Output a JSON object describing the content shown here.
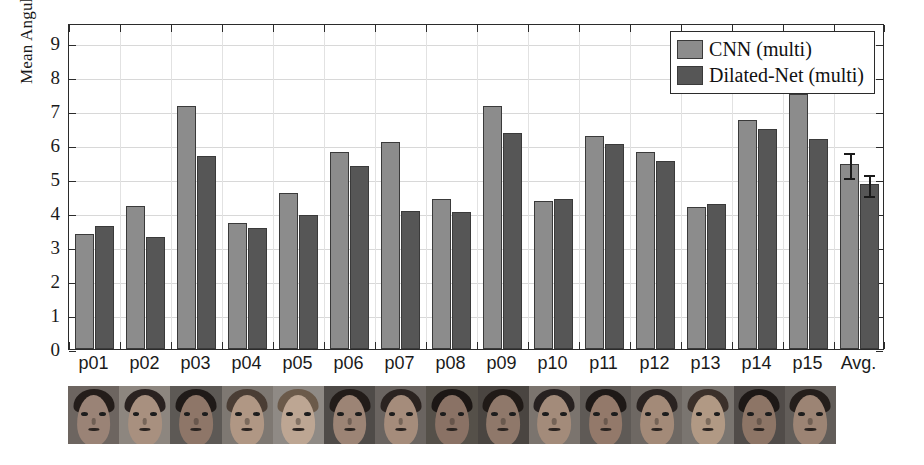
{
  "chart_data": {
    "type": "bar",
    "title": "",
    "xlabel": "",
    "ylabel": "Mean Angular Error (degree)",
    "ylim": [
      0,
      9.6
    ],
    "yticks": [
      0,
      1,
      2,
      3,
      4,
      5,
      6,
      7,
      8,
      9
    ],
    "ytick_labels": [
      "0",
      "1",
      "2",
      "3",
      "4",
      "5",
      "6",
      "7",
      "8",
      "9"
    ],
    "grid": true,
    "legend_position": "top-right",
    "categories": [
      "p01",
      "p02",
      "p03",
      "p04",
      "p05",
      "p06",
      "p07",
      "p08",
      "p09",
      "p10",
      "p11",
      "p12",
      "p13",
      "p14",
      "p15",
      "Avg."
    ],
    "series": [
      {
        "name": "CNN (multi)",
        "color": "#8c8c8c",
        "values": [
          3.4,
          4.22,
          7.16,
          3.72,
          4.6,
          5.79,
          6.09,
          4.42,
          7.16,
          4.37,
          6.26,
          5.8,
          4.17,
          6.75,
          7.5,
          5.46
        ],
        "errors": [
          null,
          null,
          null,
          null,
          null,
          null,
          null,
          null,
          null,
          null,
          null,
          null,
          null,
          null,
          null,
          0.36
        ]
      },
      {
        "name": "Dilated-Net (multi)",
        "color": "#565656",
        "values": [
          3.61,
          3.31,
          5.67,
          3.57,
          3.96,
          5.39,
          4.05,
          4.04,
          6.37,
          4.41,
          6.05,
          5.54,
          4.26,
          6.48,
          6.19,
          4.87
        ],
        "errors": [
          null,
          null,
          null,
          null,
          null,
          null,
          null,
          null,
          null,
          null,
          null,
          null,
          null,
          null,
          null,
          0.3
        ]
      }
    ]
  },
  "legend": {
    "items": [
      {
        "label": "CNN (multi)",
        "color": "#8c8c8c"
      },
      {
        "label": "Dilated-Net (multi)",
        "color": "#565656"
      }
    ]
  },
  "face_strip": {
    "count": 15,
    "thumbnails": [
      {
        "name": "face-p01",
        "skin": "#9a8376",
        "hair": "#241d1a",
        "bg": "#6d6560"
      },
      {
        "name": "face-p02",
        "skin": "#a8907f",
        "hair": "#2a2220",
        "bg": "#8d867f"
      },
      {
        "name": "face-p03",
        "skin": "#8e7668",
        "hair": "#1f1a18",
        "bg": "#5d5955"
      },
      {
        "name": "face-p04",
        "skin": "#b09784",
        "hair": "#4a3d34",
        "bg": "#7e7872"
      },
      {
        "name": "face-p05",
        "skin": "#bda693",
        "hair": "#6b5a4a",
        "bg": "#8f8a85"
      },
      {
        "name": "face-p06",
        "skin": "#9c8475",
        "hair": "#221c19",
        "bg": "#4f4b48"
      },
      {
        "name": "face-p07",
        "skin": "#a58c7b",
        "hair": "#2b2320",
        "bg": "#6a6460"
      },
      {
        "name": "face-p08",
        "skin": "#8a7265",
        "hair": "#1c1715",
        "bg": "#555049"
      },
      {
        "name": "face-p09",
        "skin": "#8f786a",
        "hair": "#201a17",
        "bg": "#4a4541"
      },
      {
        "name": "face-p10",
        "skin": "#a38b7a",
        "hair": "#272120",
        "bg": "#7b746e"
      },
      {
        "name": "face-p11",
        "skin": "#93796a",
        "hair": "#1e1917",
        "bg": "#5f5a56"
      },
      {
        "name": "face-p12",
        "skin": "#a38a78",
        "hair": "#2a2321",
        "bg": "#6e6863"
      },
      {
        "name": "face-p13",
        "skin": "#b19984",
        "hair": "#3b302a",
        "bg": "#7a7570"
      },
      {
        "name": "face-p14",
        "skin": "#8d7566",
        "hair": "#1d1816",
        "bg": "#514c49"
      },
      {
        "name": "face-p15",
        "skin": "#9c8474",
        "hair": "#241e1b",
        "bg": "#625d59"
      }
    ]
  }
}
